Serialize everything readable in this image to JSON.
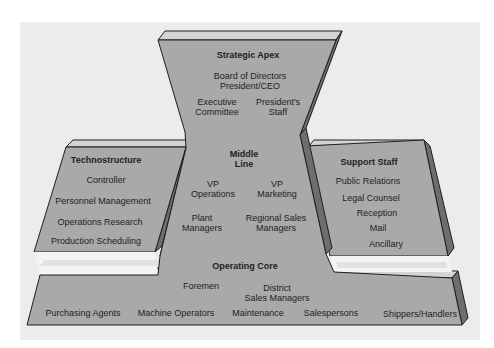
{
  "diagram": {
    "type": "organizational-structure",
    "colors": {
      "background_panel": "#ececec",
      "face": "#a9a9a9",
      "top_bevel": "#d4d4d4",
      "side_shade": "#6e6e6e",
      "outline": "#1e1e1e",
      "cavity": "#f4f4f4"
    },
    "strategic_apex": {
      "title": "Strategic Apex",
      "line1": "Board of Directors",
      "line2": "President/CEO",
      "left_item": [
        "Executive",
        "Committee"
      ],
      "right_item": [
        "President's",
        "Staff"
      ]
    },
    "middle_line": {
      "title": [
        "Middle",
        "Line"
      ],
      "items": [
        [
          "VP",
          "Operations"
        ],
        [
          "VP",
          "Marketing"
        ],
        [
          "Plant",
          "Managers"
        ],
        [
          "Regional Sales",
          "Managers"
        ]
      ]
    },
    "technostructure": {
      "title": "Technostructure",
      "items": [
        "Controller",
        "Personnel Management",
        "Operations Research",
        "Production Scheduling"
      ]
    },
    "support_staff": {
      "title": "Support Staff",
      "items": [
        "Public Relations",
        "Legal Counsel",
        "Reception",
        "Mail",
        "Ancillary"
      ]
    },
    "operating_core": {
      "title": "Operating Core",
      "upper_items": [
        [
          "Foremen"
        ],
        [
          "District",
          "Sales Managers"
        ]
      ],
      "bottom_items": [
        "Purchasing Agents",
        "Machine Operators",
        "Maintenance",
        "Salespersons",
        "Shippers/Handlers"
      ]
    }
  }
}
